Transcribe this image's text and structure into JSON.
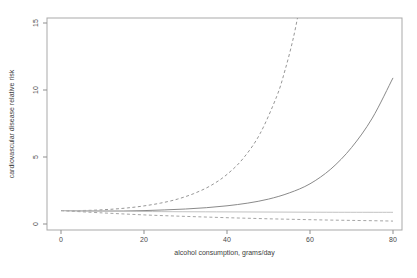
{
  "chart_data": {
    "type": "line",
    "title": "",
    "xlabel": "alcohol consumption, grams/day",
    "ylabel": "cardiovascular disease relative risk",
    "xlim": [
      0,
      80
    ],
    "ylim": [
      0,
      15
    ],
    "xticks": [
      "0",
      "20",
      "40",
      "60",
      "80"
    ],
    "yticks": [
      "0",
      "5",
      "10",
      "15"
    ],
    "grid": false,
    "legend": false,
    "box_color": "#a9a9a9",
    "tick_color": "#8f8f8f",
    "tick_label_color": "#4a4a4a",
    "series": [
      {
        "name": "dashed-steep-increasing-risk",
        "style": "dashed",
        "color": "#979797",
        "points": [
          [
            0,
            1.0
          ],
          [
            4,
            1.0
          ],
          [
            8,
            1.03
          ],
          [
            12,
            1.1
          ],
          [
            16,
            1.2
          ],
          [
            20,
            1.35
          ],
          [
            24,
            1.56
          ],
          [
            28,
            1.85
          ],
          [
            32,
            2.27
          ],
          [
            36,
            2.85
          ],
          [
            40,
            3.7
          ],
          [
            44,
            4.93
          ],
          [
            48,
            6.76
          ],
          [
            52,
            9.54
          ],
          [
            54,
            11.5
          ],
          [
            56,
            13.9
          ],
          [
            57.5,
            16.2
          ]
        ]
      },
      {
        "name": "solid-increasing-risk",
        "style": "solid",
        "color": "#8a8a8a",
        "points": [
          [
            0,
            1.0
          ],
          [
            5,
            0.98
          ],
          [
            10,
            0.97
          ],
          [
            15,
            0.97
          ],
          [
            20,
            1.0
          ],
          [
            25,
            1.05
          ],
          [
            30,
            1.12
          ],
          [
            35,
            1.22
          ],
          [
            40,
            1.36
          ],
          [
            45,
            1.56
          ],
          [
            50,
            1.86
          ],
          [
            55,
            2.32
          ],
          [
            60,
            3.0
          ],
          [
            65,
            4.1
          ],
          [
            70,
            5.7
          ],
          [
            75,
            7.9
          ],
          [
            80,
            10.9
          ]
        ]
      },
      {
        "name": "flat-reference-risk",
        "style": "solid",
        "color": "#c2c2c2",
        "points": [
          [
            0,
            1.0
          ],
          [
            10,
            0.96
          ],
          [
            20,
            0.93
          ],
          [
            40,
            0.9
          ],
          [
            60,
            0.88
          ],
          [
            80,
            0.87
          ]
        ]
      },
      {
        "name": "dashed-decreasing-risk",
        "style": "dashed",
        "color": "#a5a5a5",
        "points": [
          [
            0,
            1.0
          ],
          [
            10,
            0.83
          ],
          [
            20,
            0.68
          ],
          [
            30,
            0.57
          ],
          [
            40,
            0.47
          ],
          [
            50,
            0.39
          ],
          [
            60,
            0.32
          ],
          [
            70,
            0.27
          ],
          [
            80,
            0.22
          ]
        ]
      }
    ]
  }
}
